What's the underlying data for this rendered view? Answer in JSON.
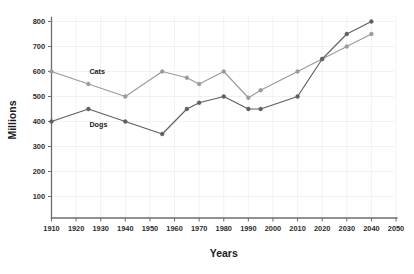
{
  "chart_data": {
    "type": "line",
    "title": "",
    "subtitle": "",
    "xlabel": "Years",
    "ylabel": "Millions",
    "grid": true,
    "legend_position": "inline-labels",
    "xlim": [
      1910,
      2050
    ],
    "ylim": [
      0,
      800
    ],
    "x_ticks": [
      1910,
      1920,
      1930,
      1940,
      1950,
      1960,
      1970,
      1980,
      1990,
      2000,
      2010,
      2020,
      2030,
      2040,
      2050
    ],
    "y_ticks": [
      100,
      200,
      300,
      400,
      500,
      600,
      700,
      800
    ],
    "x": [
      1910,
      1925,
      1940,
      1955,
      1965,
      1970,
      1980,
      1990,
      1995,
      2010,
      2020,
      2030,
      2040
    ],
    "series": [
      {
        "name": "Cats",
        "color": "#9b9b9b",
        "values": [
          600,
          550,
          500,
          600,
          575,
          550,
          600,
          495,
          525,
          600,
          650,
          700,
          750
        ]
      },
      {
        "name": "Dogs",
        "color": "#5f5f5f",
        "values": [
          400,
          450,
          400,
          350,
          450,
          475,
          500,
          450,
          450,
          500,
          650,
          750,
          800
        ]
      }
    ],
    "annotations": [
      {
        "text": "Cats",
        "x": 1925,
        "y": 600
      },
      {
        "text": "Dogs",
        "x": 1925,
        "y": 390
      }
    ]
  },
  "axes": {
    "y_axis_title": "Millions",
    "x_axis_title": "Years",
    "y_tick_labels": [
      "800",
      "700",
      "600",
      "500",
      "400",
      "300",
      "200",
      "100"
    ],
    "x_tick_labels": [
      "1910",
      "1920",
      "1930",
      "1940",
      "1950",
      "1960",
      "1970",
      "1980",
      "1990",
      "2000",
      "2010",
      "2020",
      "2030",
      "2040",
      "2050"
    ]
  },
  "series_labels": {
    "cats": "Cats",
    "dogs": "Dogs"
  },
  "colors": {
    "cats_line": "#9b9b9b",
    "dogs_line": "#5f5f5f",
    "axis": "#6d6d72",
    "grid": "#e9e9ef",
    "text": "#1b1b1b",
    "background": "#ffffff"
  }
}
